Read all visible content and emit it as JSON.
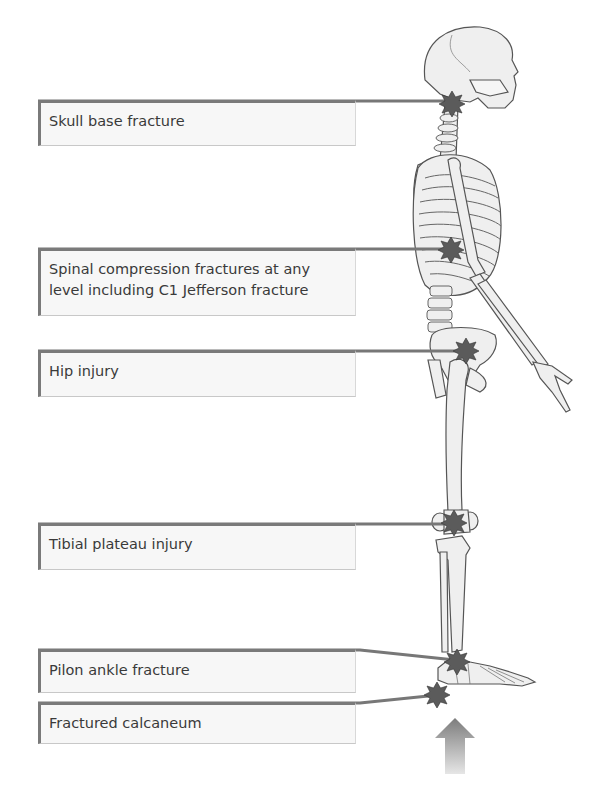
{
  "figure": {
    "type": "skeleton-lateral-view",
    "impact_arrow": {
      "direction": "up",
      "position": "under-heel"
    },
    "colors": {
      "connector": "#777777",
      "star": "#5b5b5b",
      "bone": "#efefef",
      "bone_outline": "#555555",
      "label_bg": "#f7f7f7",
      "label_text": "#3a3a3a",
      "arrow": "#8a8a8a"
    }
  },
  "labels": [
    {
      "id": "skull",
      "text": "Skull base fracture"
    },
    {
      "id": "spine",
      "line1": "Spinal compression fractures at any",
      "line2": "level including C1 Jefferson fracture"
    },
    {
      "id": "hip",
      "text": "Hip injury"
    },
    {
      "id": "tibia",
      "text": "Tibial plateau injury"
    },
    {
      "id": "pilon",
      "text": "Pilon ankle fracture"
    },
    {
      "id": "calcaneum",
      "text": "Fractured calcaneum"
    }
  ]
}
